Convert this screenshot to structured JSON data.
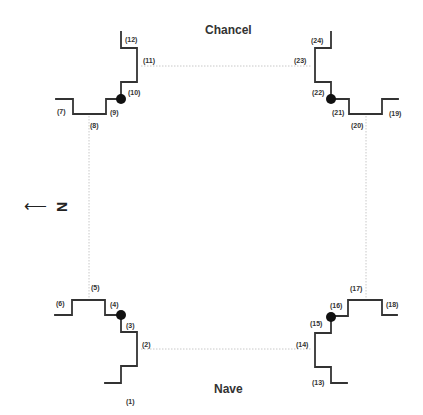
{
  "diagram": {
    "top_label": "Chancel",
    "bottom_label": "Nave",
    "north_indicator": {
      "arrow": "⟵",
      "letter": "N",
      "direction": "left"
    },
    "colors": {
      "wall": "#333333",
      "axis": "#c8c8c8",
      "marker": "#111111",
      "text": "#333333"
    },
    "point_labels": [
      "(1)",
      "(2)",
      "(3)",
      "(4)",
      "(5)",
      "(6)",
      "(7)",
      "(8)",
      "(9)",
      "(10)",
      "(11)",
      "(12)",
      "(13)",
      "(14)",
      "(15)",
      "(16)",
      "(17)",
      "(18)",
      "(19)",
      "(20)",
      "(21)",
      "(22)",
      "(23)",
      "(24)"
    ],
    "corner_markers": [
      "nw-chancel",
      "ne-chancel",
      "sw-nave",
      "se-nave"
    ]
  }
}
